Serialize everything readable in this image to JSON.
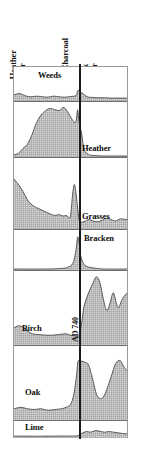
{
  "figure": {
    "headers": [
      {
        "id": "heather-mor",
        "line1": "Heather",
        "line2": "Mor"
      },
      {
        "id": "charcoal",
        "line1": "Charcoal",
        "line2": ""
      },
      {
        "id": "oak-mor",
        "line1": "Oak",
        "line2": "Mor"
      }
    ],
    "axis": {
      "name": "Charcoal",
      "date_marker": "AD 740"
    },
    "frame_color": "#9a9a9a",
    "fill_color": "#b9b9b9",
    "line_color": "#3a3a3a",
    "axis_color": "#1b1b1b"
  },
  "chart_data": {
    "type": "area",
    "subtitle": "Heather Mor / Charcoal / Oak Mor",
    "xlabel": "",
    "ylabel": "",
    "grid": false,
    "legend": "none",
    "annotations": [
      {
        "text": "AD 740",
        "type": "vertical-axis-date",
        "x_fraction": 0.565
      }
    ],
    "axis_markers": [
      {
        "name": "charcoal-line",
        "x_fraction": 0.565,
        "style": "solid vertical"
      }
    ],
    "xlim": [
      0,
      1
    ],
    "ylim": [
      0,
      1
    ],
    "series": [
      {
        "name": "Weeds",
        "label": "Weeds",
        "panel_index": 0,
        "x": [
          0.0,
          0.05,
          0.1,
          0.15,
          0.2,
          0.25,
          0.3,
          0.35,
          0.4,
          0.45,
          0.5,
          0.55,
          0.565,
          0.6,
          0.65,
          0.7,
          0.75,
          0.8,
          0.85,
          0.9,
          0.95,
          1.0
        ],
        "values": [
          0.16,
          0.2,
          0.13,
          0.1,
          0.12,
          0.1,
          0.09,
          0.12,
          0.1,
          0.09,
          0.11,
          0.14,
          0.3,
          0.22,
          0.1,
          0.08,
          0.07,
          0.07,
          0.06,
          0.06,
          0.06,
          0.06
        ]
      },
      {
        "name": "Heather",
        "label": "Heather",
        "panel_index": 1,
        "x": [
          0.0,
          0.04,
          0.08,
          0.12,
          0.16,
          0.2,
          0.24,
          0.28,
          0.32,
          0.36,
          0.4,
          0.44,
          0.48,
          0.52,
          0.545,
          0.56,
          0.565,
          0.575,
          0.6,
          0.62,
          0.66,
          0.7,
          0.8,
          0.9,
          1.0
        ],
        "values": [
          0.02,
          0.05,
          0.14,
          0.22,
          0.4,
          0.62,
          0.76,
          0.84,
          0.88,
          0.86,
          0.84,
          0.9,
          0.8,
          0.66,
          0.62,
          0.82,
          0.84,
          0.64,
          0.4,
          0.12,
          0.03,
          0.01,
          0.0,
          0.0,
          0.0
        ]
      },
      {
        "name": "Grasses",
        "label": "Grasses",
        "panel_index": 2,
        "x": [
          0.0,
          0.04,
          0.08,
          0.12,
          0.16,
          0.2,
          0.24,
          0.28,
          0.32,
          0.36,
          0.4,
          0.44,
          0.46,
          0.48,
          0.5,
          0.52,
          0.535,
          0.55,
          0.565,
          0.58,
          0.62,
          0.66,
          0.7,
          0.74,
          0.78,
          0.82,
          0.86,
          0.9,
          0.94,
          1.0
        ],
        "values": [
          0.7,
          0.62,
          0.52,
          0.4,
          0.33,
          0.29,
          0.26,
          0.23,
          0.2,
          0.18,
          0.19,
          0.17,
          0.18,
          0.16,
          0.17,
          0.5,
          0.62,
          0.48,
          0.26,
          0.1,
          0.09,
          0.12,
          0.1,
          0.09,
          0.11,
          0.14,
          0.12,
          0.1,
          0.13,
          0.12
        ]
      },
      {
        "name": "Bracken",
        "label": "Bracken",
        "panel_index": 3,
        "x": [
          0.0,
          0.3,
          0.44,
          0.48,
          0.52,
          0.545,
          0.56,
          0.565,
          0.575,
          0.59,
          0.62,
          0.66,
          0.72,
          0.8,
          1.0
        ],
        "values": [
          0.0,
          0.0,
          0.02,
          0.05,
          0.14,
          0.42,
          0.76,
          0.82,
          0.7,
          0.34,
          0.12,
          0.05,
          0.02,
          0.0,
          0.0
        ]
      },
      {
        "name": "Birch",
        "label": "Birch",
        "panel_index": 4,
        "x": [
          0.0,
          0.04,
          0.08,
          0.12,
          0.16,
          0.22,
          0.28,
          0.34,
          0.4,
          0.46,
          0.5,
          0.54,
          0.565,
          0.58,
          0.6,
          0.62,
          0.66,
          0.7,
          0.73,
          0.76,
          0.79,
          0.82,
          0.85,
          0.88,
          0.92,
          0.96,
          1.0
        ],
        "values": [
          0.22,
          0.25,
          0.23,
          0.18,
          0.14,
          0.13,
          0.12,
          0.12,
          0.13,
          0.14,
          0.12,
          0.11,
          0.1,
          0.14,
          0.3,
          0.52,
          0.7,
          0.84,
          0.92,
          0.84,
          0.62,
          0.46,
          0.56,
          0.7,
          0.5,
          0.62,
          0.7
        ]
      },
      {
        "name": "Oak",
        "label": "Oak",
        "panel_index": 5,
        "x": [
          0.0,
          0.06,
          0.12,
          0.18,
          0.24,
          0.3,
          0.36,
          0.42,
          0.46,
          0.5,
          0.53,
          0.555,
          0.565,
          0.58,
          0.62,
          0.66,
          0.7,
          0.73,
          0.76,
          0.79,
          0.82,
          0.86,
          0.9,
          0.94,
          0.97,
          1.0
        ],
        "values": [
          0.14,
          0.16,
          0.14,
          0.13,
          0.14,
          0.12,
          0.13,
          0.14,
          0.16,
          0.2,
          0.34,
          0.62,
          0.78,
          0.8,
          0.78,
          0.74,
          0.52,
          0.34,
          0.28,
          0.3,
          0.4,
          0.58,
          0.76,
          0.8,
          0.72,
          0.66
        ]
      },
      {
        "name": "Lime",
        "label": "Lime",
        "panel_index": 6,
        "x": [
          0.0,
          0.2,
          0.4,
          0.5,
          0.565,
          0.6,
          0.64,
          0.68,
          0.72,
          0.76,
          0.8,
          0.84,
          0.88,
          0.92,
          0.96,
          1.0
        ],
        "values": [
          0.06,
          0.05,
          0.06,
          0.06,
          0.08,
          0.22,
          0.34,
          0.3,
          0.4,
          0.36,
          0.3,
          0.34,
          0.3,
          0.26,
          0.22,
          0.2
        ]
      }
    ]
  }
}
